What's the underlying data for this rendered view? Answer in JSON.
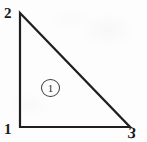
{
  "figure": {
    "type": "triangular-finite-element",
    "background_color": "#fdfdfd",
    "line_color": "#1f1f1f",
    "label_color": "#1a1a1a",
    "nodes": [
      {
        "id": "node-1",
        "label": "1",
        "position": "bottom-left",
        "x": 20,
        "y": 127
      },
      {
        "id": "node-2",
        "label": "2",
        "position": "top-left",
        "x": 20,
        "y": 13
      },
      {
        "id": "node-3",
        "label": "3",
        "position": "bottom-right",
        "x": 130,
        "y": 127
      }
    ],
    "element": {
      "id": "element-1",
      "label": "1",
      "marker": "circled-number",
      "center_x": 49,
      "center_y": 87
    },
    "edges": [
      {
        "from": "node-2",
        "to": "node-1",
        "kind": "vertical-leg"
      },
      {
        "from": "node-1",
        "to": "node-3",
        "kind": "horizontal-leg"
      },
      {
        "from": "node-2",
        "to": "node-3",
        "kind": "hypotenuse"
      }
    ]
  }
}
